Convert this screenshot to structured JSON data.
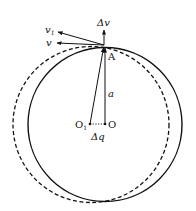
{
  "diagram": {
    "type": "geometry-physics",
    "colors": {
      "stroke": "#111111",
      "background": "#ffffff"
    },
    "circles": [
      {
        "name": "solid-circle",
        "center_label": "O",
        "cx": 105,
        "cy": 124.5,
        "r": 77,
        "style": "solid"
      },
      {
        "name": "dashed-circle",
        "center_label": "O1",
        "cx": 91,
        "cy": 124.5,
        "r": 78,
        "style": "dashed"
      }
    ],
    "points": {
      "A": {
        "label": "A",
        "x": 104,
        "y": 46
      },
      "O": {
        "label": "O",
        "x": 105,
        "y": 124
      },
      "O1": {
        "label": "O",
        "sub": "1",
        "x": 90,
        "y": 124
      }
    },
    "vectors": {
      "delta_v": {
        "label": "Δv"
      },
      "v": {
        "label": "v"
      },
      "v1": {
        "label": "v",
        "sub": "1"
      }
    },
    "segments": {
      "a": {
        "label": "a"
      },
      "delta_q": {
        "label": "Δq"
      }
    }
  }
}
